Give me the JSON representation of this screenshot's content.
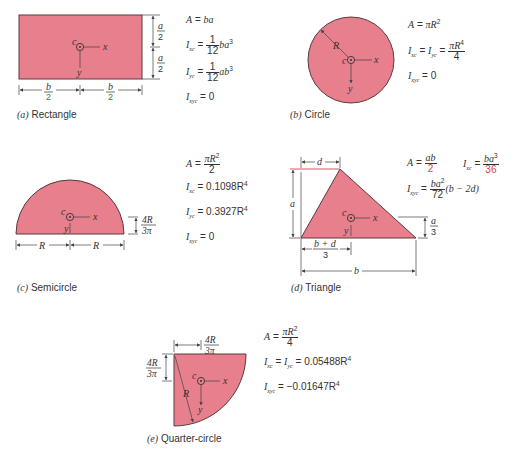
{
  "figures": {
    "rectangle": {
      "caption_letter": "(a)",
      "caption": "Rectangle",
      "labels": {
        "centroid": "c",
        "x_axis": "x",
        "y_axis": "y",
        "half_height_num": "a",
        "half_height_den": "2",
        "half_width_num": "b",
        "half_width_den": "2"
      },
      "formulas": {
        "area": {
          "lhs": "A",
          "rhs": "ba"
        },
        "ixc": {
          "lhs": "I",
          "sub": "xc",
          "coef_num": "1",
          "coef_den": "12",
          "rhs": "ba",
          "exp": "3"
        },
        "iyc": {
          "lhs": "I",
          "sub": "yc",
          "coef_num": "1",
          "coef_den": "12",
          "rhs": "ab",
          "exp": "3"
        },
        "ixyc": {
          "lhs": "I",
          "sub": "xyc",
          "rhs": "0"
        }
      }
    },
    "circle": {
      "caption_letter": "(b)",
      "caption": "Circle",
      "labels": {
        "centroid": "c",
        "x_axis": "x",
        "y_axis": "y",
        "radius": "R"
      },
      "formulas": {
        "area": {
          "lhs": "A",
          "rhs": "πR",
          "exp": "2"
        },
        "ixc_iyc": {
          "lhs1": "I",
          "sub1": "xc",
          "lhs2": "I",
          "sub2": "yc",
          "num": "πR",
          "num_exp": "4",
          "den": "4"
        },
        "ixyc": {
          "lhs": "I",
          "sub": "xyc",
          "rhs": "0"
        }
      }
    },
    "semicircle": {
      "caption_letter": "(c)",
      "caption": "Semicircle",
      "labels": {
        "centroid": "c",
        "x_axis": "x",
        "y_axis": "y",
        "radius_left": "R",
        "radius_right": "R",
        "offset_num": "4R",
        "offset_den": "3π"
      },
      "formulas": {
        "area": {
          "lhs": "A",
          "num": "πR",
          "num_exp": "2",
          "den": "2"
        },
        "ixc": {
          "lhs": "I",
          "sub": "xc",
          "rhs": "0.1098R",
          "exp": "4"
        },
        "iyc": {
          "lhs": "I",
          "sub": "yc",
          "rhs": "0.3927R",
          "exp": "4"
        },
        "ixyc": {
          "lhs": "I",
          "sub": "xyc",
          "rhs": "0"
        }
      }
    },
    "triangle": {
      "caption_letter": "(d)",
      "caption": "Triangle",
      "labels": {
        "centroid": "c",
        "x_axis": "x",
        "y_axis": "y",
        "d": "d",
        "a": "a",
        "b": "b",
        "cx_num": "b + d",
        "cx_den": "3",
        "cy_num": "a",
        "cy_den": "3"
      },
      "formulas": {
        "area": {
          "lhs": "A",
          "num": "ab",
          "den": "2"
        },
        "ixc": {
          "lhs": "I",
          "sub": "xc",
          "num": "ba",
          "num_exp": "3",
          "den": "36"
        },
        "ixyc": {
          "lhs": "I",
          "sub": "xyc",
          "num": "ba",
          "num_exp": "2",
          "den": "72",
          "tail": "(b − 2d)"
        }
      }
    },
    "quarter_circle": {
      "caption_letter": "(e)",
      "caption": "Quarter-circle",
      "labels": {
        "centroid": "c",
        "x_axis": "x",
        "y_axis": "y",
        "radius": "R",
        "offset_num": "4R",
        "offset_den": "3π"
      },
      "formulas": {
        "area": {
          "lhs": "A",
          "num": "πR",
          "num_exp": "2",
          "den": "4"
        },
        "ixc_iyc": {
          "lhs1": "I",
          "sub1": "xc",
          "lhs2": "I",
          "sub2": "yc",
          "rhs": "0.05488R",
          "exp": "4"
        },
        "ixyc": {
          "lhs": "I",
          "sub": "xyc",
          "rhs": "−0.01647R",
          "exp": "4"
        }
      }
    }
  },
  "colors": {
    "shape_fill": "#e77f8d",
    "shape_stroke": "#5a3a3c",
    "text": "#333333",
    "accent_red": "#d9414f"
  }
}
